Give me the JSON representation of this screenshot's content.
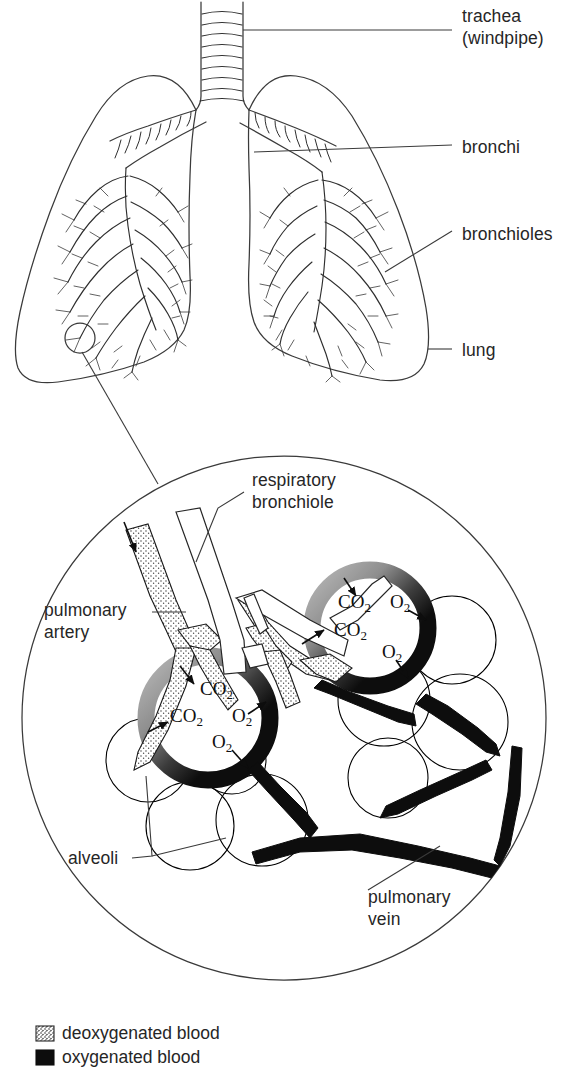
{
  "figure": {
    "overview_caption": "",
    "inset_caption": ""
  },
  "upper_labels": [
    {
      "id": "trachea",
      "line1": "trachea",
      "line2": "(windpipe)",
      "x": 462,
      "y": 22
    },
    {
      "id": "bronchi",
      "line1": "bronchi",
      "line2": "",
      "x": 462,
      "y": 150
    },
    {
      "id": "bronchioles",
      "line1": "bronchioles",
      "line2": "",
      "x": 462,
      "y": 236
    },
    {
      "id": "lung",
      "line1": "lung",
      "line2": "",
      "x": 462,
      "y": 351
    }
  ],
  "inset_labels": [
    {
      "id": "respiratory-bronchiole",
      "line1": "respiratory",
      "line2": "bronchiole",
      "x": 252,
      "y": 486
    },
    {
      "id": "pulmonary-artery",
      "line1": "pulmonary",
      "line2": "artery",
      "x": 44,
      "y": 616
    },
    {
      "id": "alveoli",
      "line1": "alveoli",
      "line2": "",
      "x": 68,
      "y": 862
    },
    {
      "id": "pulmonary-vein",
      "line1": "pulmonary",
      "line2": "vein",
      "x": 368,
      "y": 903
    }
  ],
  "gas_labels": [
    {
      "id": "upper-alveolus-co2-top",
      "base": "CO",
      "sub": "2",
      "x": 338,
      "y": 608
    },
    {
      "id": "upper-alveolus-o2-top",
      "base": "O",
      "sub": "2",
      "x": 388,
      "y": 608
    },
    {
      "id": "upper-alveolus-co2-left",
      "base": "CO",
      "sub": "2",
      "x": 336,
      "y": 634
    },
    {
      "id": "upper-alveolus-o2-bottom",
      "base": "O",
      "sub": "2",
      "x": 382,
      "y": 655
    },
    {
      "id": "lower-alveolus-co2-top",
      "base": "CO",
      "sub": "2",
      "x": 200,
      "y": 693
    },
    {
      "id": "lower-alveolus-co2-left",
      "base": "CO",
      "sub": "2",
      "x": 172,
      "y": 719
    },
    {
      "id": "lower-alveolus-o2-right",
      "base": "O",
      "sub": "2",
      "x": 232,
      "y": 720
    },
    {
      "id": "lower-alveolus-o2-bottom",
      "base": "O",
      "sub": "2",
      "x": 212,
      "y": 745
    }
  ],
  "legend": {
    "items": [
      {
        "id": "deoxygenated",
        "label": "deoxygenated blood",
        "swatch": "stippled",
        "color": "#cfcfcf"
      },
      {
        "id": "oxygenated",
        "label": "oxygenated blood",
        "swatch": "solid",
        "color": "#0d0d0d"
      }
    ]
  },
  "colors": {
    "ink": "#262626",
    "outline": "#3a3a3a",
    "oxygenated": "#0d0d0d",
    "deoxygenated_fill": "#e8e8e8",
    "background": "#ffffff"
  }
}
